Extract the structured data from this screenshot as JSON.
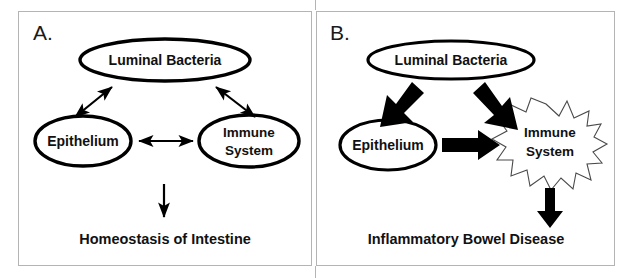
{
  "figure": {
    "background_color": "#ffffff",
    "stroke_color": "#000000",
    "frame_color": "#b4b4b4",
    "burst_stroke_color": "#4a4a4a"
  },
  "panels": [
    {
      "id": "panel-a",
      "letter": "A.",
      "nodes": {
        "luminal_bacteria": "Luminal  Bacteria",
        "epithelium": "Epithelium",
        "immune_system_line1": "Immune",
        "immune_system_line2": "System"
      },
      "outcome": "Homeostasis of Intestine",
      "arrows": [
        {
          "name": "bacteria-epithelium",
          "style": "thin",
          "heads": "double"
        },
        {
          "name": "bacteria-immune",
          "style": "thin",
          "heads": "double"
        },
        {
          "name": "epithelium-immune",
          "style": "thin",
          "heads": "double"
        },
        {
          "name": "to-outcome",
          "style": "thin",
          "heads": "single"
        }
      ]
    },
    {
      "id": "panel-b",
      "letter": "B.",
      "nodes": {
        "luminal_bacteria": "Luminal  Bacteria",
        "epithelium": "Epithelium",
        "immune_system_line1": "Immune",
        "immune_system_line2": "System"
      },
      "outcome": "Inflammatory Bowel Disease",
      "arrows": [
        {
          "name": "bacteria-epithelium",
          "style": "thick",
          "heads": "single"
        },
        {
          "name": "bacteria-immune",
          "style": "thick",
          "heads": "single"
        },
        {
          "name": "epithelium-immune",
          "style": "thick",
          "heads": "single"
        },
        {
          "name": "to-outcome",
          "style": "thick",
          "heads": "single"
        }
      ]
    }
  ]
}
